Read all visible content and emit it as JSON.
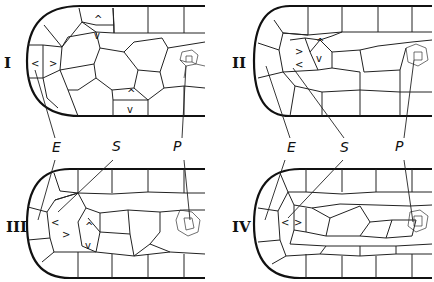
{
  "figure": {
    "panels": [
      {
        "numeral": "I",
        "marks": [
          "<",
          ">",
          "^",
          "v",
          "^",
          "v"
        ]
      },
      {
        "numeral": "II",
        "marks": [
          "<",
          ">",
          "^",
          "v"
        ]
      },
      {
        "numeral": "III",
        "marks": [
          "<",
          ">",
          "^",
          "v"
        ]
      },
      {
        "numeral": "IV",
        "marks": [
          "<",
          ">"
        ]
      }
    ],
    "labels": {
      "left": {
        "E": "E",
        "S": "S",
        "P": "P"
      },
      "right": {
        "E": "E",
        "S": "S",
        "P": "P"
      }
    }
  }
}
